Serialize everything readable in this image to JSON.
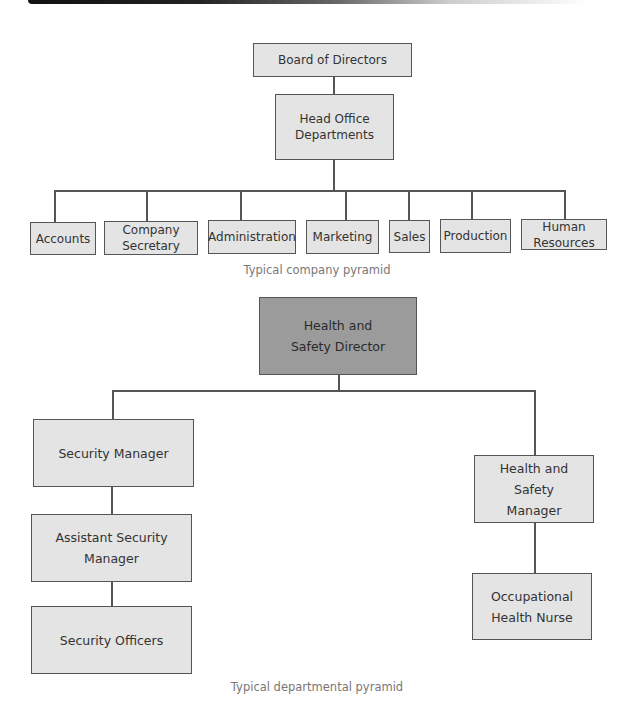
{
  "company_pyramid": {
    "top": "Board of Directors",
    "head_office": "Head Office Departments",
    "departments": [
      "Accounts",
      "Company Secretary",
      "Administration",
      "Marketing",
      "Sales",
      "Production",
      "Human Resources"
    ],
    "caption": "Typical company pyramid"
  },
  "departmental_pyramid": {
    "director": "Health and Safety Director",
    "left_branch": [
      "Security Manager",
      "Assistant Security Manager",
      "Security Officers"
    ],
    "right_branch": [
      "Health and Safety Manager",
      "Occupational Health Nurse"
    ],
    "caption": "Typical departmental pyramid"
  },
  "colors": {
    "box_fill": "#e4e4e4",
    "director_fill": "#9b9b9b",
    "border": "#555555"
  }
}
